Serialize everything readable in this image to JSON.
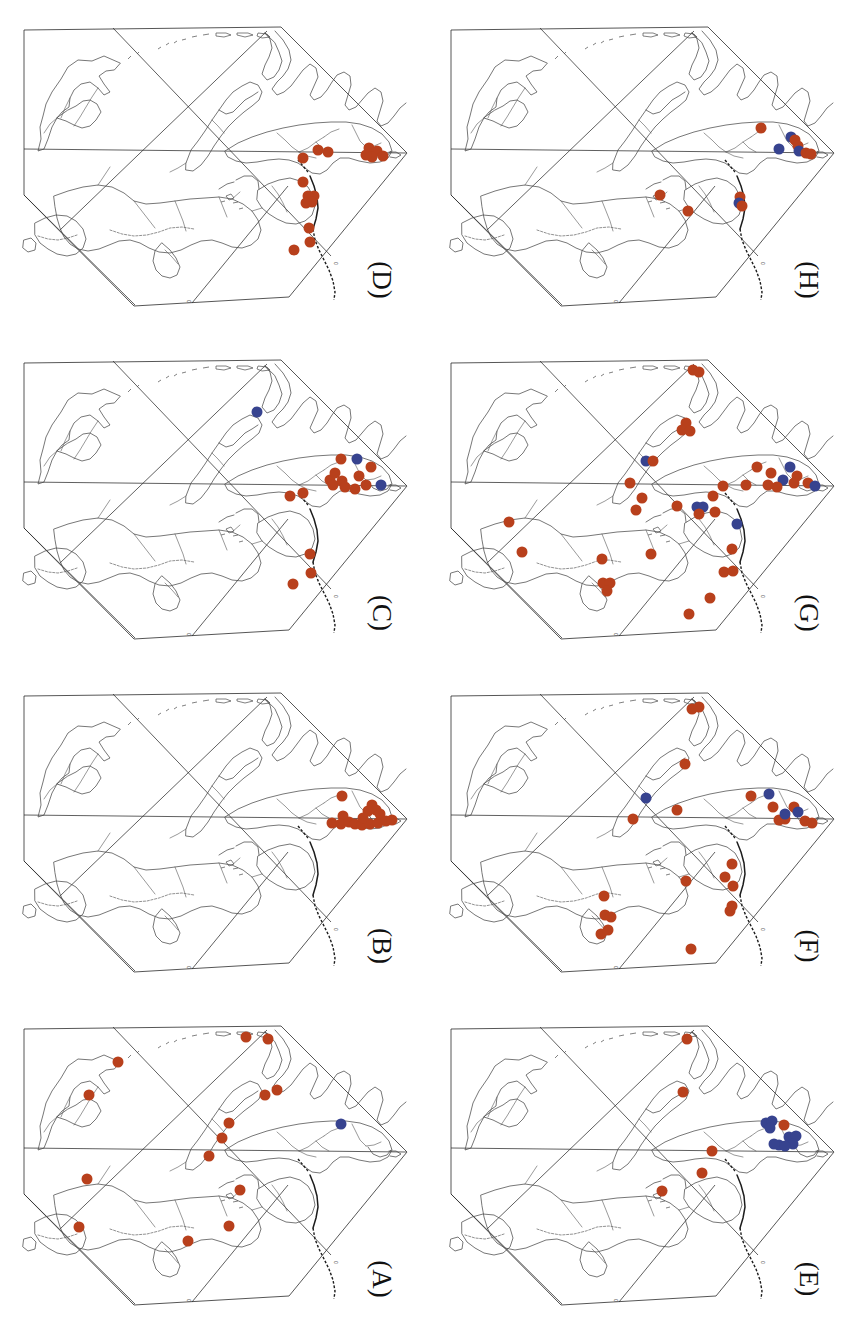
{
  "figure": {
    "type": "multi-panel-distribution-map",
    "panel_count": 8,
    "grid": "2 columns x 4 rows",
    "orientation_note": "map and labels rotated 90 degrees clockwise",
    "marker_colors": {
      "red": "#b8401c",
      "blue": "#37438f"
    },
    "marker_radius_px": 5.5,
    "tick_label": "0"
  },
  "panels": [
    {
      "id": "D",
      "label": "(D)",
      "position": {
        "col": 1,
        "row": 1
      },
      "counts": {
        "red": 16,
        "blue": 0
      },
      "markers": [
        {
          "x": 318,
          "y": 150,
          "c": "red"
        },
        {
          "x": 328,
          "y": 152,
          "c": "red"
        },
        {
          "x": 369,
          "y": 148,
          "c": "red"
        },
        {
          "x": 377,
          "y": 151,
          "c": "red"
        },
        {
          "x": 372,
          "y": 157,
          "c": "red"
        },
        {
          "x": 383,
          "y": 156,
          "c": "red"
        },
        {
          "x": 366,
          "y": 155,
          "c": "red"
        },
        {
          "x": 303,
          "y": 158,
          "c": "red"
        },
        {
          "x": 303,
          "y": 182,
          "c": "red"
        },
        {
          "x": 314,
          "y": 196,
          "c": "red"
        },
        {
          "x": 308,
          "y": 196,
          "c": "red"
        },
        {
          "x": 312,
          "y": 202,
          "c": "red"
        },
        {
          "x": 306,
          "y": 203,
          "c": "red"
        },
        {
          "x": 309,
          "y": 228,
          "c": "red"
        },
        {
          "x": 310,
          "y": 242,
          "c": "red"
        },
        {
          "x": 294,
          "y": 250,
          "c": "red"
        }
      ]
    },
    {
      "id": "H",
      "label": "(H)",
      "position": {
        "col": 2,
        "row": 1
      },
      "counts": {
        "red": 9,
        "blue": 4
      },
      "markers": [
        {
          "x": 334,
          "y": 128,
          "c": "red"
        },
        {
          "x": 364,
          "y": 137,
          "c": "blue"
        },
        {
          "x": 368,
          "y": 140,
          "c": "red"
        },
        {
          "x": 371,
          "y": 146,
          "c": "red"
        },
        {
          "x": 372,
          "y": 151,
          "c": "blue"
        },
        {
          "x": 379,
          "y": 153,
          "c": "red"
        },
        {
          "x": 384,
          "y": 154,
          "c": "red"
        },
        {
          "x": 352,
          "y": 149,
          "c": "blue"
        },
        {
          "x": 233,
          "y": 195,
          "c": "red"
        },
        {
          "x": 261,
          "y": 211,
          "c": "red"
        },
        {
          "x": 313,
          "y": 197,
          "c": "red"
        },
        {
          "x": 312,
          "y": 203,
          "c": "blue"
        },
        {
          "x": 315,
          "y": 206,
          "c": "red"
        }
      ]
    },
    {
      "id": "C",
      "label": "(C)",
      "position": {
        "col": 1,
        "row": 2
      },
      "counts": {
        "red": 15,
        "blue": 3
      },
      "markers": [
        {
          "x": 257,
          "y": 79,
          "c": "blue"
        },
        {
          "x": 341,
          "y": 126,
          "c": "red"
        },
        {
          "x": 357,
          "y": 126,
          "c": "blue"
        },
        {
          "x": 371,
          "y": 134,
          "c": "red"
        },
        {
          "x": 330,
          "y": 147,
          "c": "red"
        },
        {
          "x": 333,
          "y": 152,
          "c": "red"
        },
        {
          "x": 342,
          "y": 148,
          "c": "red"
        },
        {
          "x": 345,
          "y": 154,
          "c": "red"
        },
        {
          "x": 355,
          "y": 156,
          "c": "red"
        },
        {
          "x": 366,
          "y": 152,
          "c": "red"
        },
        {
          "x": 381,
          "y": 152,
          "c": "blue"
        },
        {
          "x": 290,
          "y": 163,
          "c": "red"
        },
        {
          "x": 303,
          "y": 160,
          "c": "red"
        },
        {
          "x": 310,
          "y": 221,
          "c": "red"
        },
        {
          "x": 311,
          "y": 240,
          "c": "red"
        },
        {
          "x": 293,
          "y": 251,
          "c": "red"
        },
        {
          "x": 335,
          "y": 140,
          "c": "red"
        },
        {
          "x": 359,
          "y": 143,
          "c": "red"
        }
      ]
    },
    {
      "id": "G",
      "label": "(G)",
      "position": {
        "col": 2,
        "row": 2
      },
      "counts": {
        "red": 34,
        "blue": 7
      },
      "markers": [
        {
          "x": 266,
          "y": 37,
          "c": "red"
        },
        {
          "x": 272,
          "y": 39,
          "c": "red"
        },
        {
          "x": 259,
          "y": 90,
          "c": "red"
        },
        {
          "x": 255,
          "y": 97,
          "c": "red"
        },
        {
          "x": 263,
          "y": 98,
          "c": "red"
        },
        {
          "x": 219,
          "y": 128,
          "c": "blue"
        },
        {
          "x": 226,
          "y": 128,
          "c": "red"
        },
        {
          "x": 203,
          "y": 150,
          "c": "red"
        },
        {
          "x": 330,
          "y": 134,
          "c": "red"
        },
        {
          "x": 344,
          "y": 140,
          "c": "red"
        },
        {
          "x": 363,
          "y": 134,
          "c": "blue"
        },
        {
          "x": 370,
          "y": 143,
          "c": "red"
        },
        {
          "x": 356,
          "y": 147,
          "c": "blue"
        },
        {
          "x": 367,
          "y": 150,
          "c": "red"
        },
        {
          "x": 381,
          "y": 150,
          "c": "red"
        },
        {
          "x": 388,
          "y": 153,
          "c": "blue"
        },
        {
          "x": 296,
          "y": 153,
          "c": "red"
        },
        {
          "x": 319,
          "y": 152,
          "c": "red"
        },
        {
          "x": 350,
          "y": 154,
          "c": "red"
        },
        {
          "x": 215,
          "y": 165,
          "c": "red"
        },
        {
          "x": 209,
          "y": 177,
          "c": "red"
        },
        {
          "x": 250,
          "y": 173,
          "c": "red"
        },
        {
          "x": 286,
          "y": 163,
          "c": "red"
        },
        {
          "x": 270,
          "y": 174,
          "c": "blue"
        },
        {
          "x": 276,
          "y": 174,
          "c": "blue"
        },
        {
          "x": 272,
          "y": 181,
          "c": "red"
        },
        {
          "x": 288,
          "y": 179,
          "c": "red"
        },
        {
          "x": 310,
          "y": 191,
          "c": "blue"
        },
        {
          "x": 82,
          "y": 189,
          "c": "red"
        },
        {
          "x": 95,
          "y": 219,
          "c": "red"
        },
        {
          "x": 175,
          "y": 226,
          "c": "red"
        },
        {
          "x": 224,
          "y": 221,
          "c": "red"
        },
        {
          "x": 305,
          "y": 216,
          "c": "red"
        },
        {
          "x": 176,
          "y": 250,
          "c": "red"
        },
        {
          "x": 183,
          "y": 250,
          "c": "red"
        },
        {
          "x": 180,
          "y": 258,
          "c": "red"
        },
        {
          "x": 297,
          "y": 239,
          "c": "red"
        },
        {
          "x": 306,
          "y": 238,
          "c": "red"
        },
        {
          "x": 283,
          "y": 265,
          "c": "red"
        },
        {
          "x": 262,
          "y": 281,
          "c": "red"
        },
        {
          "x": 341,
          "y": 152,
          "c": "red"
        }
      ]
    },
    {
      "id": "B",
      "label": "(B)",
      "position": {
        "col": 1,
        "row": 3
      },
      "counts": {
        "red": 16,
        "blue": 0
      },
      "markers": [
        {
          "x": 342,
          "y": 130,
          "c": "red"
        },
        {
          "x": 372,
          "y": 139,
          "c": "red"
        },
        {
          "x": 376,
          "y": 144,
          "c": "red"
        },
        {
          "x": 368,
          "y": 145,
          "c": "red"
        },
        {
          "x": 380,
          "y": 148,
          "c": "red"
        },
        {
          "x": 343,
          "y": 150,
          "c": "red"
        },
        {
          "x": 332,
          "y": 157,
          "c": "red"
        },
        {
          "x": 341,
          "y": 158,
          "c": "red"
        },
        {
          "x": 349,
          "y": 156,
          "c": "red"
        },
        {
          "x": 355,
          "y": 158,
          "c": "red"
        },
        {
          "x": 362,
          "y": 159,
          "c": "red"
        },
        {
          "x": 370,
          "y": 158,
          "c": "red"
        },
        {
          "x": 378,
          "y": 157,
          "c": "red"
        },
        {
          "x": 386,
          "y": 155,
          "c": "red"
        },
        {
          "x": 392,
          "y": 154,
          "c": "red"
        },
        {
          "x": 363,
          "y": 152,
          "c": "red"
        }
      ]
    },
    {
      "id": "F",
      "label": "(F)",
      "position": {
        "col": 2,
        "row": 3
      },
      "counts": {
        "red": 24,
        "blue": 4
      },
      "markers": [
        {
          "x": 265,
          "y": 43,
          "c": "red"
        },
        {
          "x": 272,
          "y": 41,
          "c": "red"
        },
        {
          "x": 258,
          "y": 98,
          "c": "red"
        },
        {
          "x": 219,
          "y": 132,
          "c": "blue"
        },
        {
          "x": 206,
          "y": 153,
          "c": "red"
        },
        {
          "x": 250,
          "y": 144,
          "c": "red"
        },
        {
          "x": 324,
          "y": 130,
          "c": "red"
        },
        {
          "x": 342,
          "y": 128,
          "c": "blue"
        },
        {
          "x": 346,
          "y": 141,
          "c": "red"
        },
        {
          "x": 367,
          "y": 141,
          "c": "red"
        },
        {
          "x": 371,
          "y": 146,
          "c": "blue"
        },
        {
          "x": 358,
          "y": 153,
          "c": "red"
        },
        {
          "x": 352,
          "y": 154,
          "c": "red"
        },
        {
          "x": 378,
          "y": 155,
          "c": "red"
        },
        {
          "x": 385,
          "y": 157,
          "c": "red"
        },
        {
          "x": 358,
          "y": 148,
          "c": "blue"
        },
        {
          "x": 305,
          "y": 198,
          "c": "red"
        },
        {
          "x": 259,
          "y": 215,
          "c": "red"
        },
        {
          "x": 298,
          "y": 211,
          "c": "red"
        },
        {
          "x": 306,
          "y": 220,
          "c": "red"
        },
        {
          "x": 303,
          "y": 245,
          "c": "red"
        },
        {
          "x": 305,
          "y": 240,
          "c": "red"
        },
        {
          "x": 177,
          "y": 230,
          "c": "red"
        },
        {
          "x": 178,
          "y": 249,
          "c": "red"
        },
        {
          "x": 184,
          "y": 251,
          "c": "red"
        },
        {
          "x": 174,
          "y": 268,
          "c": "red"
        },
        {
          "x": 181,
          "y": 264,
          "c": "red"
        },
        {
          "x": 264,
          "y": 283,
          "c": "red"
        }
      ]
    },
    {
      "id": "A",
      "label": "(A)",
      "position": {
        "col": 1,
        "row": 4
      },
      "counts": {
        "red": 14,
        "blue": 1
      },
      "markers": [
        {
          "x": 246,
          "y": 38,
          "c": "red"
        },
        {
          "x": 268,
          "y": 40,
          "c": "red"
        },
        {
          "x": 118,
          "y": 63,
          "c": "red"
        },
        {
          "x": 89,
          "y": 96,
          "c": "red"
        },
        {
          "x": 265,
          "y": 96,
          "c": "red"
        },
        {
          "x": 277,
          "y": 91,
          "c": "red"
        },
        {
          "x": 229,
          "y": 124,
          "c": "red"
        },
        {
          "x": 222,
          "y": 139,
          "c": "red"
        },
        {
          "x": 209,
          "y": 157,
          "c": "red"
        },
        {
          "x": 341,
          "y": 125,
          "c": "blue"
        },
        {
          "x": 87,
          "y": 180,
          "c": "red"
        },
        {
          "x": 240,
          "y": 191,
          "c": "red"
        },
        {
          "x": 79,
          "y": 228,
          "c": "red"
        },
        {
          "x": 188,
          "y": 242,
          "c": "red"
        },
        {
          "x": 229,
          "y": 227,
          "c": "red"
        }
      ]
    },
    {
      "id": "E",
      "label": "(E)",
      "position": {
        "col": 2,
        "row": 4
      },
      "counts": {
        "red": 6,
        "blue": 9
      },
      "markers": [
        {
          "x": 260,
          "y": 40,
          "c": "red"
        },
        {
          "x": 256,
          "y": 93,
          "c": "red"
        },
        {
          "x": 339,
          "y": 124,
          "c": "blue"
        },
        {
          "x": 345,
          "y": 122,
          "c": "blue"
        },
        {
          "x": 343,
          "y": 129,
          "c": "blue"
        },
        {
          "x": 357,
          "y": 126,
          "c": "red"
        },
        {
          "x": 362,
          "y": 138,
          "c": "blue"
        },
        {
          "x": 369,
          "y": 137,
          "c": "blue"
        },
        {
          "x": 366,
          "y": 145,
          "c": "blue"
        },
        {
          "x": 352,
          "y": 146,
          "c": "blue"
        },
        {
          "x": 358,
          "y": 147,
          "c": "blue"
        },
        {
          "x": 347,
          "y": 145,
          "c": "blue"
        },
        {
          "x": 285,
          "y": 152,
          "c": "red"
        },
        {
          "x": 275,
          "y": 174,
          "c": "red"
        },
        {
          "x": 235,
          "y": 192,
          "c": "red"
        }
      ]
    }
  ]
}
